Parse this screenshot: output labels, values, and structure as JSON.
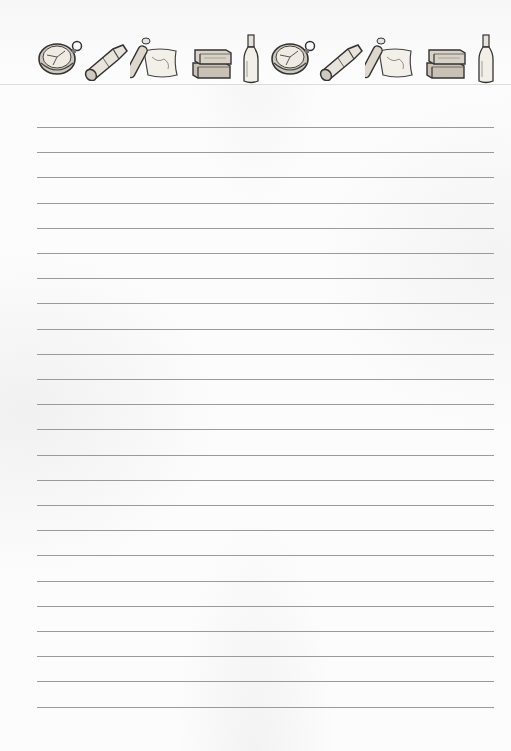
{
  "page": {
    "type": "lined-stationery",
    "background_color": "#fcfcfc",
    "line_color": "#9a9a9a",
    "line_count": 24,
    "first_line_y": 127,
    "line_spacing": 25.2,
    "line_left": 37,
    "line_right": 494
  },
  "header_strip": {
    "icons": [
      {
        "name": "compass",
        "x": 37
      },
      {
        "name": "spyglass",
        "x": 83
      },
      {
        "name": "treasure-map-scroll",
        "x": 130
      },
      {
        "name": "stacked-books",
        "x": 190
      },
      {
        "name": "bottle",
        "x": 241
      },
      {
        "name": "compass",
        "x": 270
      },
      {
        "name": "spyglass",
        "x": 318
      },
      {
        "name": "treasure-map-scroll",
        "x": 365
      },
      {
        "name": "stacked-books",
        "x": 424
      },
      {
        "name": "bottle",
        "x": 476
      }
    ]
  }
}
